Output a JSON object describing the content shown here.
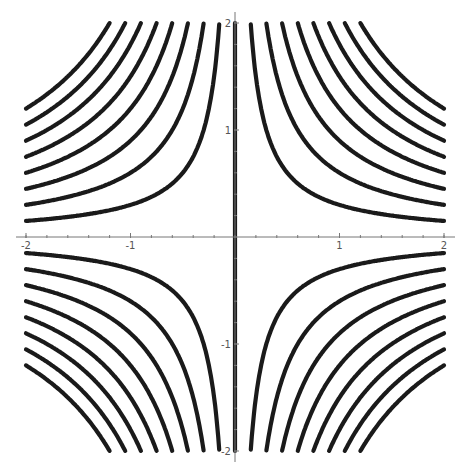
{
  "chart_data": {
    "type": "line",
    "title": "",
    "xlabel": "",
    "ylabel": "",
    "xlim": [
      -2,
      2
    ],
    "ylim": [
      -2,
      2
    ],
    "grid": false,
    "legend": null,
    "x_ticks": [
      -2,
      -1,
      1,
      2
    ],
    "x_tick_labels": [
      "-2",
      "-1",
      "1",
      "2"
    ],
    "y_ticks": [
      -2,
      -1,
      1,
      2
    ],
    "y_tick_labels": [
      "-2",
      "-1",
      "1",
      "2"
    ],
    "contour_levels": [
      -2.4,
      -2.1,
      -1.8,
      -1.5,
      -1.2,
      -0.9,
      -0.6,
      -0.3,
      0,
      0.3,
      0.6,
      0.9,
      1.2,
      1.5,
      1.8,
      2.1,
      2.4
    ],
    "series": [
      {
        "name": "xy=0",
        "values": "vertical line x=0"
      },
      {
        "name": "xy=c>0",
        "quadrants": [
          "I",
          "III"
        ]
      },
      {
        "name": "xy=c<0",
        "quadrants": [
          "II",
          "IV"
        ]
      }
    ],
    "line_color": "#1a1a1a",
    "axis_color": "#777777"
  }
}
